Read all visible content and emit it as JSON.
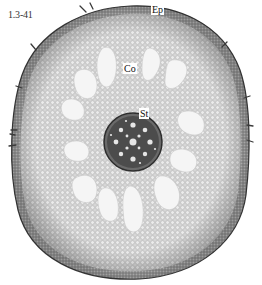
{
  "figure": {
    "number": "1.3-41",
    "labels": [
      {
        "id": "ep",
        "text": "Ep",
        "meaning": "epidermis",
        "x": 151,
        "y": 6
      },
      {
        "id": "co",
        "text": "Co",
        "meaning": "cortex",
        "x": 123,
        "y": 64
      },
      {
        "id": "st",
        "text": "St",
        "meaning": "stele",
        "x": 139,
        "y": 110
      }
    ]
  },
  "colors": {
    "background": "#ffffff",
    "outer_tissue": "#b5b5b5",
    "cortex": "#d9d9d9",
    "air_spaces": "#f4f4f4",
    "stele": "#4a4a4a",
    "epidermis_edge": "#3a3a3a"
  }
}
